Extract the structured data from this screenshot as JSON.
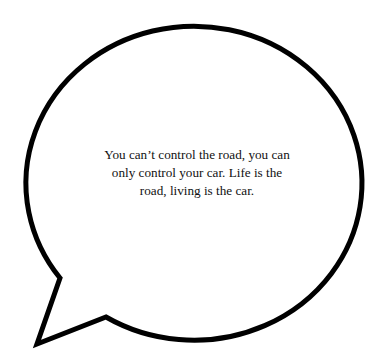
{
  "speech_bubble": {
    "quote_lines": [
      "You can’t control the road, you can",
      "only control your car. Life is the",
      "road, living is the car."
    ],
    "stroke_color": "#000000",
    "fill_color": "#ffffff",
    "text_color": "#111111"
  }
}
